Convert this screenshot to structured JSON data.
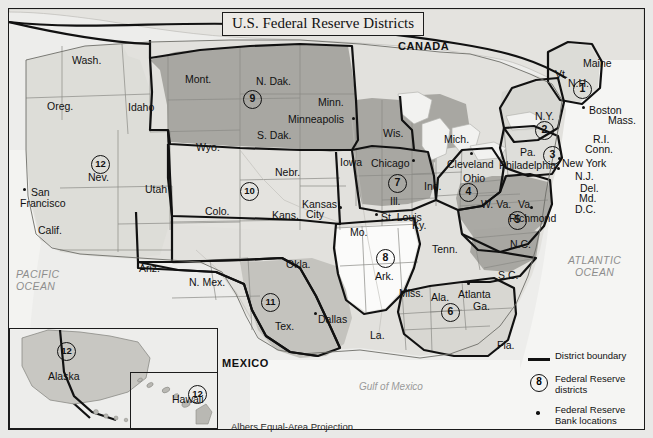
{
  "title": "U.S. Federal Reserve Districts",
  "projection_note": "Albers Equal-Area Projection",
  "countries": [
    {
      "name": "CANADA",
      "x": 398,
      "y": 40
    },
    {
      "name": "MEXICO",
      "x": 222,
      "y": 357
    }
  ],
  "oceans": [
    {
      "name": "PACIFIC",
      "x": 16,
      "y": 268
    },
    {
      "name": "OCEAN",
      "x": 16,
      "y": 280
    },
    {
      "name": "ATLANTIC",
      "x": 568,
      "y": 254
    },
    {
      "name": "OCEAN",
      "x": 575,
      "y": 266
    },
    {
      "name": "Gulf of Mexico",
      "x": 359,
      "y": 381
    }
  ],
  "states": [
    {
      "label": "Wash.",
      "x": 72,
      "y": 54
    },
    {
      "label": "Oreg.",
      "x": 47,
      "y": 100
    },
    {
      "label": "Idaho",
      "x": 128,
      "y": 101
    },
    {
      "label": "Mont.",
      "x": 185,
      "y": 73
    },
    {
      "label": "N. Dak.",
      "x": 256,
      "y": 75
    },
    {
      "label": "Minn.",
      "x": 318,
      "y": 96
    },
    {
      "label": "S. Dak.",
      "x": 257,
      "y": 129
    },
    {
      "label": "Wyo.",
      "x": 196,
      "y": 141
    },
    {
      "label": "Nev.",
      "x": 88,
      "y": 171
    },
    {
      "label": "Utah",
      "x": 145,
      "y": 183
    },
    {
      "label": "Calif.",
      "x": 38,
      "y": 224
    },
    {
      "label": "Colo.",
      "x": 205,
      "y": 205
    },
    {
      "label": "Nebr.",
      "x": 275,
      "y": 166
    },
    {
      "label": "Kans.",
      "x": 272,
      "y": 209
    },
    {
      "label": "Iowa",
      "x": 340,
      "y": 156
    },
    {
      "label": "Wis.",
      "x": 383,
      "y": 127
    },
    {
      "label": "Mich.",
      "x": 444,
      "y": 133
    },
    {
      "label": "Ill.",
      "x": 390,
      "y": 195
    },
    {
      "label": "Ind.",
      "x": 424,
      "y": 180
    },
    {
      "label": "Ohio",
      "x": 463,
      "y": 172
    },
    {
      "label": "Mo.",
      "x": 350,
      "y": 226
    },
    {
      "label": "Ky.",
      "x": 412,
      "y": 219
    },
    {
      "label": "Tenn.",
      "x": 432,
      "y": 243
    },
    {
      "label": "Ark.",
      "x": 375,
      "y": 270
    },
    {
      "label": "Okla.",
      "x": 286,
      "y": 258
    },
    {
      "label": "Ariz.",
      "x": 139,
      "y": 262
    },
    {
      "label": "N. Mex.",
      "x": 189,
      "y": 276
    },
    {
      "label": "Tex.",
      "x": 275,
      "y": 320
    },
    {
      "label": "La.",
      "x": 370,
      "y": 329
    },
    {
      "label": "Miss.",
      "x": 399,
      "y": 287
    },
    {
      "label": "Ala.",
      "x": 431,
      "y": 291
    },
    {
      "label": "Ga.",
      "x": 473,
      "y": 300
    },
    {
      "label": "Fla.",
      "x": 497,
      "y": 339
    },
    {
      "label": "S.C.",
      "x": 498,
      "y": 269
    },
    {
      "label": "N.C.",
      "x": 510,
      "y": 238
    },
    {
      "label": "W. Va.",
      "x": 481,
      "y": 198
    },
    {
      "label": "Va.",
      "x": 518,
      "y": 198
    },
    {
      "label": "Pa.",
      "x": 520,
      "y": 146
    },
    {
      "label": "N.Y.",
      "x": 535,
      "y": 110
    },
    {
      "label": "Vt.",
      "x": 555,
      "y": 68
    },
    {
      "label": "N.H.",
      "x": 568,
      "y": 77
    },
    {
      "label": "Maine",
      "x": 583,
      "y": 57
    },
    {
      "label": "Mass.",
      "x": 608,
      "y": 114
    },
    {
      "label": "R.I.",
      "x": 593,
      "y": 133
    },
    {
      "label": "Conn.",
      "x": 585,
      "y": 143
    },
    {
      "label": "N.J.",
      "x": 575,
      "y": 170
    },
    {
      "label": "Del.",
      "x": 580,
      "y": 182
    },
    {
      "label": "Md.",
      "x": 579,
      "y": 192
    },
    {
      "label": "D.C.",
      "x": 575,
      "y": 203
    },
    {
      "label": "Alaska",
      "x": 48,
      "y": 370
    },
    {
      "label": "Hawaii",
      "x": 172,
      "y": 393
    }
  ],
  "cities": [
    {
      "label": "San",
      "x": 31,
      "y": 186,
      "dot_x": 23,
      "dot_y": 188,
      "multiline": true
    },
    {
      "label": "Francisco",
      "x": 20,
      "y": 197,
      "no_dot": true
    },
    {
      "label": "Minneapolis",
      "x": 288,
      "y": 113,
      "dot_x": 352,
      "dot_y": 117
    },
    {
      "label": "Chicago",
      "x": 371,
      "y": 157,
      "dot_x": 412,
      "dot_y": 159
    },
    {
      "label": "Cleveland",
      "x": 447,
      "y": 158,
      "dot_x": 470,
      "dot_y": 152
    },
    {
      "label": "Kansas",
      "x": 302,
      "y": 198,
      "dot_x": 339,
      "dot_y": 206
    },
    {
      "label": "City",
      "x": 306,
      "y": 208,
      "no_dot": true
    },
    {
      "label": "St. Louis",
      "x": 381,
      "y": 211,
      "dot_x": 375,
      "dot_y": 213
    },
    {
      "label": "Dallas",
      "x": 318,
      "y": 313,
      "dot_x": 314,
      "dot_y": 312
    },
    {
      "label": "Atlanta",
      "x": 458,
      "y": 288,
      "dot_x": 467,
      "dot_y": 282
    },
    {
      "label": "Richmond",
      "x": 509,
      "y": 212,
      "dot_x": 530,
      "dot_y": 206
    },
    {
      "label": "Philadelphia",
      "x": 499,
      "y": 159,
      "dot_x": 557,
      "dot_y": 167
    },
    {
      "label": "New York",
      "x": 562,
      "y": 157,
      "dot_x": 558,
      "dot_y": 157
    },
    {
      "label": "Boston",
      "x": 589,
      "y": 104,
      "dot_x": 582,
      "dot_y": 106
    }
  ],
  "districts": [
    {
      "number": "1",
      "x": 573,
      "y": 80
    },
    {
      "number": "2",
      "x": 535,
      "y": 121
    },
    {
      "number": "3",
      "x": 543,
      "y": 146
    },
    {
      "number": "4",
      "x": 459,
      "y": 183
    },
    {
      "number": "5",
      "x": 508,
      "y": 211
    },
    {
      "number": "6",
      "x": 441,
      "y": 303
    },
    {
      "number": "7",
      "x": 388,
      "y": 174
    },
    {
      "number": "8",
      "x": 376,
      "y": 249
    },
    {
      "number": "9",
      "x": 243,
      "y": 90
    },
    {
      "number": "10",
      "x": 240,
      "y": 182
    },
    {
      "number": "11",
      "x": 261,
      "y": 293
    },
    {
      "number": "12",
      "x": 91,
      "y": 155
    },
    {
      "number": "12",
      "x": 57,
      "y": 342
    },
    {
      "number": "12",
      "x": 188,
      "y": 385
    }
  ],
  "legend": {
    "boundary_label": "District boundary",
    "districts_label_1": "Federal Reserve",
    "districts_label_2": "districts",
    "districts_number": "8",
    "banks_label_1": "Federal Reserve",
    "banks_label_2": "Bank locations"
  },
  "colors": {
    "background": "#e9e9e7",
    "land_light": "#e3e2de",
    "district_mid": "#c9c8c3",
    "district_dark": "#a9a8a3",
    "water": "#f4f4f2",
    "outline": "#111111"
  }
}
